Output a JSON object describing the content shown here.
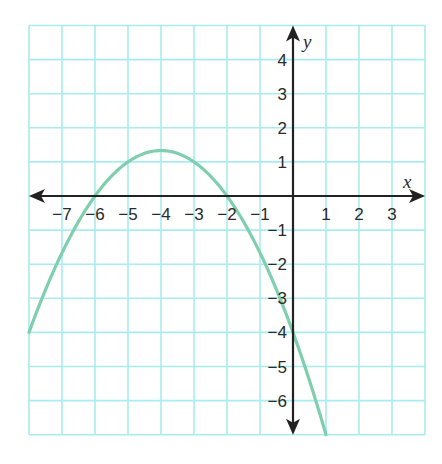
{
  "chart_data": {
    "type": "line",
    "title": "",
    "xlabel": "x",
    "ylabel": "y",
    "xlim": [
      -8,
      4
    ],
    "ylim": [
      -7,
      5
    ],
    "grid": true,
    "x_ticks": [
      -7,
      -6,
      -5,
      -4,
      -3,
      -2,
      -1,
      1,
      2,
      3
    ],
    "y_ticks": [
      4,
      3,
      2,
      1,
      -1,
      -2,
      -3,
      -4,
      -5,
      -6
    ],
    "x_tick_labels": [
      "−7",
      "−6",
      "−5",
      "−4",
      "−3",
      "−2",
      "−1",
      "1",
      "2",
      "3"
    ],
    "y_tick_labels": [
      "4",
      "3",
      "2",
      "1",
      "−1",
      "−2",
      "−3",
      "−4",
      "−5",
      "−6"
    ],
    "series": [
      {
        "name": "parabola",
        "equation": "y = -1/3 (x + 2)(x + 6)",
        "vertex": [
          -4,
          1.33
        ],
        "x_intercepts": [
          -6,
          -2
        ],
        "y_intercept": -4,
        "x": [
          -8,
          -7,
          -6,
          -5,
          -4,
          -3,
          -2,
          -1,
          0,
          1
        ],
        "values": [
          -4,
          -1.67,
          0,
          1,
          1.33,
          1,
          0,
          -1.67,
          -4,
          -7
        ],
        "color": "#7fcfae"
      }
    ],
    "colors": {
      "grid": "#a9ecef",
      "axis": "#222222",
      "curve": "#7fcfae"
    }
  }
}
